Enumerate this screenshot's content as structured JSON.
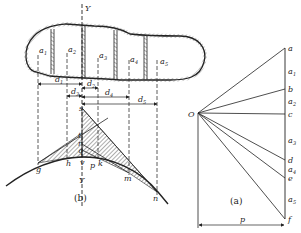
{
  "figure_b": {
    "caption": "(b)",
    "axis_top_label": "Y",
    "axis_bottom_label": "Y",
    "segments": [
      {
        "base": "a",
        "sub": "1"
      },
      {
        "base": "a",
        "sub": "2"
      },
      {
        "base": "a",
        "sub": "3"
      },
      {
        "base": "a",
        "sub": "4"
      },
      {
        "base": "a",
        "sub": "5"
      }
    ],
    "distances": [
      {
        "base": "d",
        "sub": "1"
      },
      {
        "base": "d",
        "sub": "2"
      },
      {
        "base": "d",
        "sub": "3"
      },
      {
        "base": "d",
        "sub": "4"
      },
      {
        "base": "d",
        "sub": "5"
      }
    ],
    "points": {
      "s": "s",
      "t": "t",
      "r": "r",
      "q": "q",
      "v": "v",
      "p": "p",
      "g": "g",
      "h": "h",
      "k": "k",
      "m": "m",
      "n": "n"
    }
  },
  "figure_a": {
    "caption": "(a)",
    "pole": "O",
    "pole_distance": "p",
    "points": [
      "a",
      "b",
      "c",
      "d",
      "e",
      "f"
    ],
    "loads": [
      {
        "base": "a",
        "sub": "1"
      },
      {
        "base": "a",
        "sub": "2"
      },
      {
        "base": "a",
        "sub": "3"
      },
      {
        "base": "a",
        "sub": "4"
      },
      {
        "base": "a",
        "sub": "5"
      }
    ]
  }
}
